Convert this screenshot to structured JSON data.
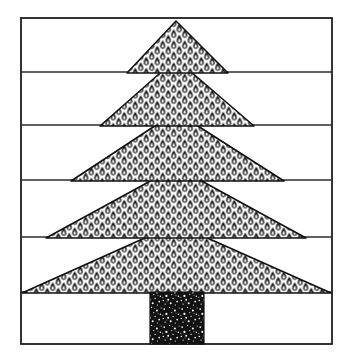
{
  "artwork": {
    "title": "Christmas tree line drawing",
    "caption": "",
    "background_color": "#ffffff",
    "ink_color": "#1a1a1a",
    "canvas": {
      "width": 352,
      "height": 357
    }
  },
  "frame": {
    "name": "page-frame",
    "x": 21,
    "y": 18,
    "width": 311,
    "height": 326,
    "stroke_color": "#1f1f1f",
    "stroke_width": 1.8,
    "fill": "#ffffff"
  },
  "rules": {
    "label": "horizontal ruled lines",
    "stroke_color": "#2b2b2b",
    "stroke_width": 1.4,
    "y_positions": [
      72,
      125,
      180,
      237,
      292
    ]
  },
  "tree": {
    "name": "christmas-tree",
    "tier_count": 5,
    "outline_color": "#111111",
    "outline_width": 1.6,
    "fill_pattern": "pine-needle-teardrop",
    "pattern_color": "#101010",
    "pattern_cell_width": 11,
    "pattern_cell_height": 11,
    "tiers": [
      {
        "name": "tier-1-top",
        "apex_x": 176,
        "apex_y": 21,
        "base_y": 73,
        "base_left_x": 127,
        "base_right_x": 228
      },
      {
        "name": "tier-2",
        "apex_x": 176,
        "apex_y": 59,
        "base_y": 126,
        "base_left_x": 100,
        "base_right_x": 254
      },
      {
        "name": "tier-3",
        "apex_x": 176,
        "apex_y": 112,
        "base_y": 181,
        "base_left_x": 71,
        "base_right_x": 284
      },
      {
        "name": "tier-4",
        "apex_x": 176,
        "apex_y": 167,
        "base_y": 238,
        "base_left_x": 46,
        "base_right_x": 306
      },
      {
        "name": "tier-5-bottom",
        "apex_x": 176,
        "apex_y": 224,
        "base_y": 293,
        "base_left_x": 22,
        "base_right_x": 331
      }
    ]
  },
  "trunk": {
    "name": "tree-trunk",
    "x": 150,
    "y": 292,
    "width": 54,
    "height": 52,
    "fill_color": "#121212",
    "speckle_color": "#ffffff",
    "texture": "white-stipple-speckle"
  }
}
